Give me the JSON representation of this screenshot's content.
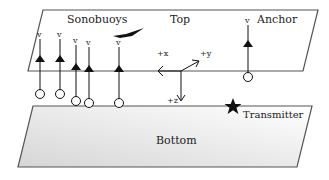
{
  "diagram": {
    "top_plane": {
      "label": "Top"
    },
    "bottom_plane": {
      "label": "Bottom"
    },
    "labels": {
      "sonobuoys": "Sonobuoys",
      "anchor": "Anchor",
      "transmitter": "Transmitter"
    },
    "axes": {
      "x": "+x",
      "y": "+y",
      "z": "+z"
    },
    "sensor_symbol": "v",
    "buoys": [
      {
        "x": 40,
        "tri_y": 58,
        "v_y": 37,
        "circle_y": 94
      },
      {
        "x": 60,
        "tri_y": 58,
        "v_y": 37,
        "circle_y": 94
      },
      {
        "x": 76,
        "tri_y": 66,
        "v_y": 43,
        "circle_y": 101
      },
      {
        "x": 89,
        "tri_y": 68,
        "v_y": 45,
        "circle_y": 103
      },
      {
        "x": 119,
        "tri_y": 68,
        "v_y": 45,
        "circle_y": 103
      }
    ],
    "anchor_buoy": {
      "x": 248,
      "tri_y": 42,
      "v_y": 23,
      "circle_y": 77
    },
    "colors": {
      "plane_stroke": "#555555",
      "bottom_fill_start": "#ffffff",
      "bottom_fill_end": "#d8d8d8",
      "ink": "#111111"
    }
  }
}
